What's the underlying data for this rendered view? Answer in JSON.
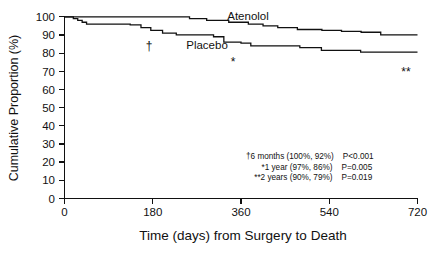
{
  "chart_data": {
    "type": "line",
    "subtype": "kaplan-meier-step",
    "title": "",
    "xlabel": "Time (days) from Surgery to Death",
    "ylabel": "Cumulative Proportion (%)",
    "xlim": [
      0,
      720
    ],
    "ylim": [
      0,
      100
    ],
    "xticks": [
      0,
      180,
      360,
      540,
      720
    ],
    "yticks": [
      0,
      10,
      20,
      30,
      40,
      50,
      60,
      70,
      80,
      90,
      100
    ],
    "xtick_labels": [
      "0",
      "180",
      "360",
      "540",
      "720"
    ],
    "ytick_labels": [
      "0",
      "10",
      "20",
      "30",
      "40",
      "50",
      "60",
      "70",
      "80",
      "90",
      "100"
    ],
    "grid": false,
    "legend_position": "inline-on-curves",
    "series": [
      {
        "name": "Atenolol",
        "label_x": 375,
        "label_y": 99,
        "points": [
          [
            0,
            100
          ],
          [
            250,
            100
          ],
          [
            255,
            99
          ],
          [
            285,
            99
          ],
          [
            290,
            98
          ],
          [
            330,
            98
          ],
          [
            335,
            97
          ],
          [
            370,
            97
          ],
          [
            375,
            96
          ],
          [
            400,
            96
          ],
          [
            405,
            95
          ],
          [
            430,
            95
          ],
          [
            435,
            94
          ],
          [
            470,
            94
          ],
          [
            475,
            93
          ],
          [
            520,
            93
          ],
          [
            525,
            92.5
          ],
          [
            560,
            92.5
          ],
          [
            565,
            92
          ],
          [
            600,
            92
          ],
          [
            605,
            91.5
          ],
          [
            640,
            91.5
          ],
          [
            645,
            90
          ],
          [
            690,
            90
          ],
          [
            720,
            90
          ]
        ]
      },
      {
        "name": "Placebo",
        "label_x": 205,
        "label_y": 88,
        "points": [
          [
            0,
            100
          ],
          [
            15,
            100
          ],
          [
            18,
            99
          ],
          [
            24,
            99
          ],
          [
            27,
            98
          ],
          [
            33,
            98
          ],
          [
            36,
            97
          ],
          [
            42,
            97
          ],
          [
            45,
            96
          ],
          [
            130,
            96
          ],
          [
            134,
            95.5
          ],
          [
            152,
            95.5
          ],
          [
            156,
            94
          ],
          [
            172,
            94
          ],
          [
            176,
            92.5
          ],
          [
            196,
            92.5
          ],
          [
            200,
            91
          ],
          [
            225,
            91
          ],
          [
            228,
            90
          ],
          [
            300,
            90
          ],
          [
            304,
            89
          ],
          [
            320,
            89
          ],
          [
            325,
            86
          ],
          [
            355,
            86
          ],
          [
            360,
            85.5
          ],
          [
            375,
            85.5
          ],
          [
            380,
            84
          ],
          [
            475,
            84
          ],
          [
            480,
            83
          ],
          [
            520,
            83
          ],
          [
            524,
            81.5
          ],
          [
            600,
            81.5
          ],
          [
            604,
            80.5
          ],
          [
            650,
            80.5
          ],
          [
            720,
            80.5
          ]
        ]
      }
    ],
    "annotations": [
      {
        "marker": "†",
        "x": 180,
        "y": 84,
        "description": "†6 months (100%, 92%)",
        "p_value": "P<0.001"
      },
      {
        "marker": "*",
        "x": 360,
        "y": 76,
        "description": "*1 year (97%, 86%)",
        "p_value": "P=0.005"
      },
      {
        "marker": "**",
        "x": 713,
        "y": 68,
        "description": "**2 years (90%, 79%)",
        "p_value": "P=0.019"
      }
    ],
    "stats_table": [
      {
        "timepoint": "6 months",
        "atenolol": "100%",
        "placebo": "92%",
        "p": "P<0.001",
        "marker": "†"
      },
      {
        "timepoint": "1 year",
        "atenolol": "97%",
        "placebo": "86%",
        "p": "P=0.005",
        "marker": "*"
      },
      {
        "timepoint": "2 years",
        "atenolol": "90%",
        "placebo": "79%",
        "p": "P=0.019",
        "marker": "**"
      }
    ],
    "colors": {
      "axis": "#111111",
      "curve": "#111111",
      "background": "#ffffff"
    }
  },
  "axes": {
    "y_title": "Cumulative Proportion (%)",
    "x_title": "Time (days) from Surgery to Death",
    "y_ticks": [
      "100",
      "90",
      "80",
      "70",
      "60",
      "50",
      "40",
      "30",
      "20",
      "10",
      "0"
    ],
    "x_ticks": [
      "0",
      "180",
      "360",
      "540",
      "720"
    ]
  },
  "curve_labels": {
    "upper": "Atenolol",
    "lower": "Placebo"
  },
  "markers": {
    "dagger": "†",
    "asterisk": "*",
    "double_asterisk": "**"
  },
  "notes": [
    {
      "desc": "†6 months (100%, 92%)",
      "p": "P<0.001"
    },
    {
      "desc": "*1 year (97%, 86%)",
      "p": "P=0.005"
    },
    {
      "desc": "**2 years (90%, 79%)",
      "p": "P=0.019"
    }
  ]
}
